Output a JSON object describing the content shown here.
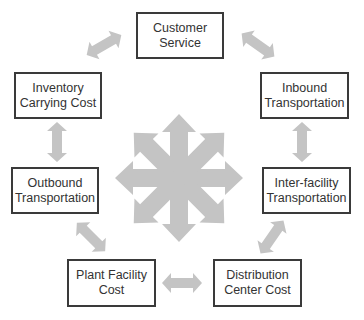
{
  "diagram": {
    "arrow_color": "#c4c4c4",
    "border_color": "#3a3a3a",
    "text_color": "#333333",
    "center": {
      "label": "",
      "icon": "eight-way-arrow-star"
    },
    "nodes": [
      {
        "id": "customer-service",
        "line1": "Customer",
        "line2": "Service"
      },
      {
        "id": "inventory-carrying-cost",
        "line1": "Inventory",
        "line2": "Carrying Cost"
      },
      {
        "id": "inbound-transportation",
        "line1": "Inbound",
        "line2": "Transportation"
      },
      {
        "id": "outbound-transportation",
        "line1": "Outbound",
        "line2": "Transportation"
      },
      {
        "id": "inter-facility-transportation",
        "line1": "Inter-facility",
        "line2": "Transportation"
      },
      {
        "id": "plant-facility-cost",
        "line1": "Plant Facility",
        "line2": "Cost"
      },
      {
        "id": "distribution-center-cost",
        "line1": "Distribution",
        "line2": "Center Cost"
      }
    ],
    "connections": [
      [
        "inventory-carrying-cost",
        "customer-service"
      ],
      [
        "customer-service",
        "inbound-transportation"
      ],
      [
        "inventory-carrying-cost",
        "outbound-transportation"
      ],
      [
        "inbound-transportation",
        "inter-facility-transportation"
      ],
      [
        "outbound-transportation",
        "plant-facility-cost"
      ],
      [
        "inter-facility-transportation",
        "distribution-center-cost"
      ],
      [
        "plant-facility-cost",
        "distribution-center-cost"
      ]
    ]
  }
}
